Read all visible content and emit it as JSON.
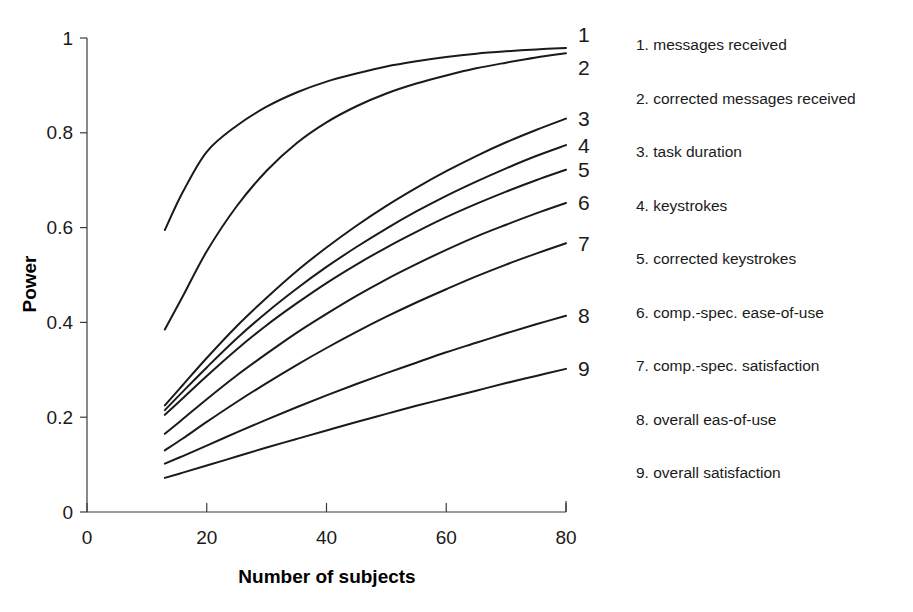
{
  "chart_data": {
    "type": "line",
    "title": "",
    "xlabel": "Number of subjects",
    "ylabel": "Power",
    "xlim": [
      0,
      80
    ],
    "ylim": [
      0,
      1
    ],
    "xticks": [
      "0",
      "20",
      "40",
      "60",
      "80"
    ],
    "yticks": [
      "0",
      "0.2",
      "0.4",
      "0.6",
      "0.8",
      "1"
    ],
    "xtick_values": [
      0,
      20,
      40,
      60,
      80
    ],
    "ytick_values": [
      0,
      0.2,
      0.4,
      0.6,
      0.8,
      1
    ],
    "grid": false,
    "legend_position": "right",
    "x": [
      13,
      16,
      20,
      25,
      30,
      35,
      40,
      45,
      50,
      55,
      60,
      65,
      70,
      75,
      80
    ],
    "series": [
      {
        "name": "messages received",
        "number": "1",
        "end_label": "1",
        "values": [
          0.595,
          0.675,
          0.76,
          0.815,
          0.855,
          0.885,
          0.908,
          0.925,
          0.94,
          0.951,
          0.96,
          0.967,
          0.972,
          0.976,
          0.979
        ]
      },
      {
        "name": "corrected messages received",
        "number": "2",
        "end_label": "2",
        "values": [
          0.385,
          0.455,
          0.55,
          0.645,
          0.72,
          0.778,
          0.822,
          0.856,
          0.883,
          0.904,
          0.921,
          0.936,
          0.948,
          0.959,
          0.968
        ]
      },
      {
        "name": "task duration",
        "number": "3",
        "end_label": "3",
        "values": [
          0.225,
          0.268,
          0.325,
          0.392,
          0.452,
          0.508,
          0.558,
          0.604,
          0.646,
          0.684,
          0.719,
          0.751,
          0.78,
          0.806,
          0.83
        ]
      },
      {
        "name": "keystrokes",
        "number": "4",
        "end_label": "4",
        "values": [
          0.215,
          0.254,
          0.305,
          0.366,
          0.421,
          0.471,
          0.517,
          0.559,
          0.598,
          0.634,
          0.667,
          0.697,
          0.725,
          0.751,
          0.774
        ]
      },
      {
        "name": "corrected keystrokes",
        "number": "5",
        "end_label": "5",
        "values": [
          0.205,
          0.24,
          0.287,
          0.343,
          0.394,
          0.44,
          0.483,
          0.522,
          0.558,
          0.591,
          0.622,
          0.65,
          0.676,
          0.7,
          0.722
        ]
      },
      {
        "name": "comp.-spec. ease-of-use",
        "number": "6",
        "end_label": "6",
        "values": [
          0.165,
          0.196,
          0.238,
          0.288,
          0.334,
          0.378,
          0.418,
          0.456,
          0.491,
          0.523,
          0.553,
          0.581,
          0.606,
          0.63,
          0.652
        ]
      },
      {
        "name": "comp.-spec. satisfaction",
        "number": "7",
        "end_label": "7",
        "values": [
          0.13,
          0.155,
          0.19,
          0.232,
          0.272,
          0.31,
          0.346,
          0.38,
          0.412,
          0.442,
          0.47,
          0.497,
          0.522,
          0.545,
          0.567
        ]
      },
      {
        "name": "overall eas-of-use",
        "number": "8",
        "end_label": "8",
        "values": [
          0.102,
          0.118,
          0.14,
          0.168,
          0.195,
          0.221,
          0.246,
          0.27,
          0.293,
          0.315,
          0.337,
          0.357,
          0.377,
          0.396,
          0.414
        ]
      },
      {
        "name": "overall satisfaction",
        "number": "9",
        "end_label": "9",
        "values": [
          0.072,
          0.083,
          0.098,
          0.117,
          0.136,
          0.154,
          0.172,
          0.19,
          0.207,
          0.224,
          0.24,
          0.256,
          0.272,
          0.287,
          0.302
        ]
      }
    ]
  },
  "legend": {
    "items": [
      {
        "text": "1. messages received"
      },
      {
        "text": "2. corrected messages received"
      },
      {
        "text": "3. task duration"
      },
      {
        "text": "4. keystrokes"
      },
      {
        "text": "5. corrected keystrokes"
      },
      {
        "text": "6. comp.-spec. ease-of-use"
      },
      {
        "text": "7. comp.-spec. satisfaction"
      },
      {
        "text": "8. overall eas-of-use"
      },
      {
        "text": "9. overall satisfaction"
      }
    ]
  },
  "colors": {
    "curve": "#1a1a1a",
    "axis": "#3a3a3a",
    "background": "#ffffff"
  }
}
